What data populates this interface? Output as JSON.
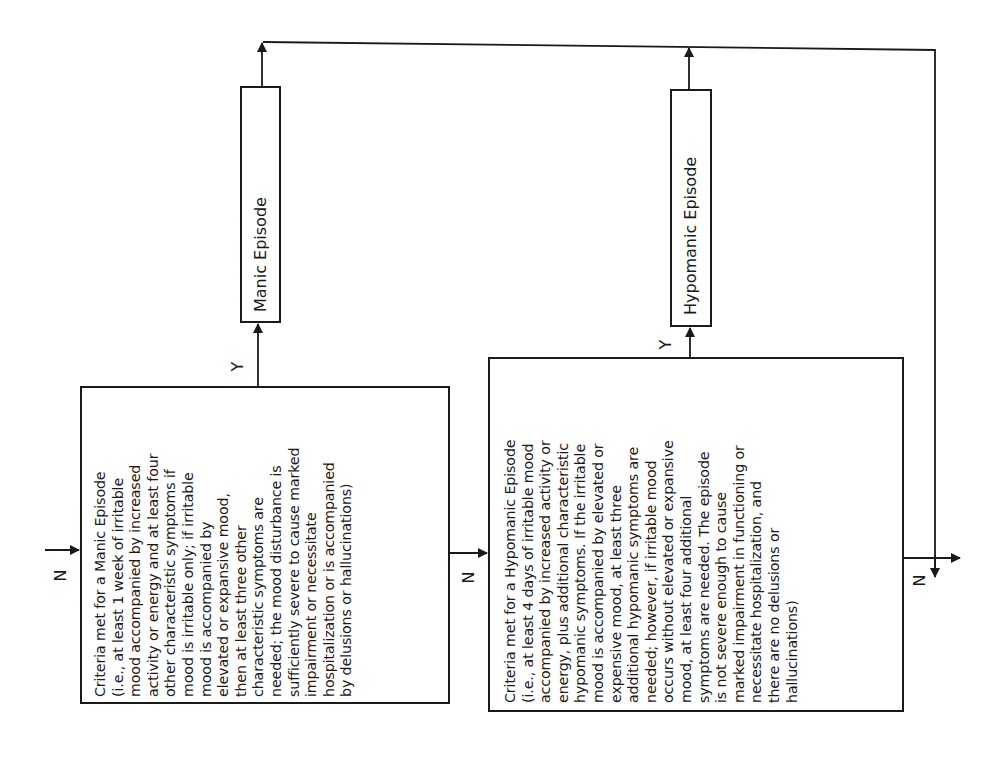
{
  "diagram": {
    "type": "flowchart-decision-tree",
    "orientation": "rotated-90-ccw",
    "nodes": {
      "manic_criteria": {
        "lines": [
          "Criteria met for a Manic Episode",
          "(i.e., at least 1 week of irritable",
          "mood accompanied by increased",
          "activity or energy and at least four",
          "other characteristic symptoms if",
          "mood is irritable only; if irritable",
          "mood is accompanied by",
          "elevated or expansive mood,",
          "then at least three other",
          "characteristic symptoms are",
          "needed; the mood disturbance is",
          "sufficiently severe to cause marked",
          "impairment or necessitate",
          "hospitalization or is accompanied",
          "by delusions or hallucinations)"
        ]
      },
      "manic_episode": {
        "label": "Manic Episode"
      },
      "hypomanic_criteria": {
        "lines": [
          "Criteria met for a Hypomanic Episode",
          "(i.e., at least 4 days of irritable mood",
          "accompanied by increased activity or",
          "energy, plus additional characteristic",
          "hypomanic symptoms. If the irritable",
          "mood is accompanied by elevated or",
          "expensive mood, at least three",
          "additional hypomanic symptoms are",
          "needed; however, if irritable mood",
          "occurs without elevated or expansive",
          "mood, at least four additional",
          "symptoms are needed. The episode",
          "is not severe enough to cause",
          "marked impairment in functioning or",
          "necessitate hospitalization, and",
          "there are no delusions or",
          "hallucinations)"
        ]
      },
      "hypomanic_episode": {
        "label": "Hypomanic Episode"
      }
    },
    "edge_labels": {
      "entry_no": "N",
      "manic_yes": "Y",
      "manic_no": "N",
      "hypomanic_yes": "Y",
      "hypomanic_no": "N"
    },
    "colors": {
      "line": "#1a1a1a",
      "background": "#ffffff"
    }
  }
}
